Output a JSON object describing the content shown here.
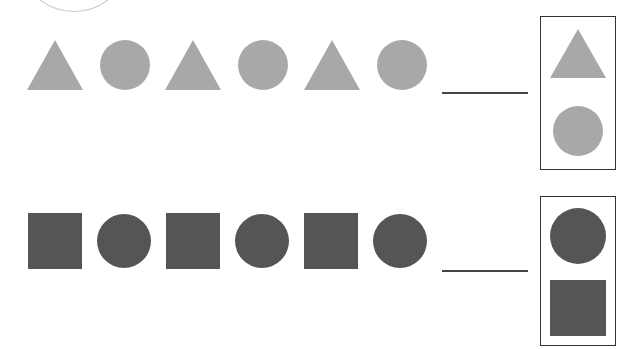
{
  "colors": {
    "light_gray": "#a8a8a8",
    "dark_gray": "#555555",
    "line": "#444444",
    "box_border": "#333333"
  },
  "rows": [
    {
      "sequence": [
        "triangle",
        "circle",
        "triangle",
        "circle",
        "triangle",
        "circle"
      ],
      "color": "light_gray",
      "blank": "answer-blank",
      "options": [
        "triangle",
        "circle"
      ]
    },
    {
      "sequence": [
        "square",
        "circle",
        "square",
        "circle",
        "square",
        "circle"
      ],
      "color": "dark_gray",
      "blank": "answer-blank",
      "options": [
        "circle",
        "square"
      ]
    }
  ]
}
